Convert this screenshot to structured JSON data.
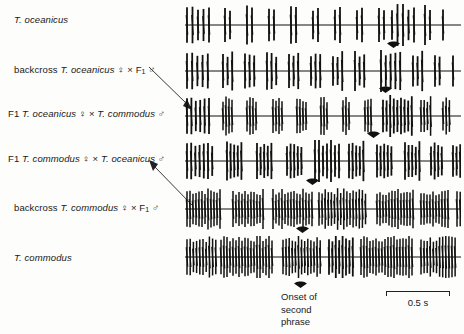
{
  "figure": {
    "kind": "oscillogram-panel",
    "ink_color": "#111111",
    "background": "#fdfdfb"
  },
  "rows": [
    {
      "id": "t-oceanicus",
      "label_parts": [
        "T. oceanicus"
      ],
      "label_plain": "T. oceanicus",
      "onset_arrow_x": 393
    },
    {
      "id": "backcross-oceanicus",
      "label_parts": [
        "backcross ",
        "T. oceanicus",
        " ♀ × F",
        "1",
        " ♂"
      ],
      "label_plain": "backcross T. oceanicus ♀ × F1 ♂",
      "onset_arrow_x": 385
    },
    {
      "id": "f1-oceanicus-x-commodus",
      "label_parts": [
        "F1 ",
        "T. oceanicus",
        " ♀ × ",
        "T. commodus",
        " ♂"
      ],
      "label_plain": "F1 T. oceanicus ♀ × T. commodus ♂",
      "onset_arrow_x": 373
    },
    {
      "id": "f1-commodus-x-oceanicus",
      "label_parts": [
        "F1 ",
        "T. commodus",
        " ♀ × ",
        "T. oceanicus",
        " ♂"
      ],
      "label_plain": "F1 T. commodus ♀ × T. oceanicus ♂",
      "onset_arrow_x": 312
    },
    {
      "id": "backcross-commodus",
      "label_parts": [
        "backcross ",
        "T. commodus",
        " ♀ × F",
        "1",
        " ♂"
      ],
      "label_plain": "backcross T. commodus ♀ × F1 ♂",
      "onset_arrow_x": 302
    },
    {
      "id": "t-commodus",
      "label_parts": [
        "T. commodus"
      ],
      "label_plain": "T. commodus",
      "onset_arrow_x": 300
    }
  ],
  "caption": {
    "line1": "Onset of",
    "line2": "second",
    "line3": "phrase"
  },
  "scale": {
    "label": "0.5 s",
    "duration_s": 0.5,
    "bar_px": 65
  },
  "chart_data": {
    "type": "line",
    "title": "",
    "xlabel": "time",
    "ylabel": "sound pressure",
    "scale_bar_seconds": 0.5,
    "series": [
      {
        "name": "T. oceanicus",
        "groups": [
          {
            "start": 2,
            "pulses": 5,
            "spacing": 5.5,
            "amp": 1.0
          },
          {
            "start": 40,
            "pulses": 2,
            "spacing": 5.0,
            "amp": 0.95
          },
          {
            "start": 62,
            "pulses": 2,
            "spacing": 5.0,
            "amp": 0.95
          },
          {
            "start": 84,
            "pulses": 2,
            "spacing": 5.0,
            "amp": 0.95
          },
          {
            "start": 106,
            "pulses": 2,
            "spacing": 5.0,
            "amp": 0.95
          },
          {
            "start": 128,
            "pulses": 2,
            "spacing": 5.0,
            "amp": 0.95
          },
          {
            "start": 150,
            "pulses": 2,
            "spacing": 5.0,
            "amp": 0.95
          },
          {
            "start": 172,
            "pulses": 2,
            "spacing": 5.0,
            "amp": 0.95
          },
          {
            "start": 194,
            "pulses": 2,
            "spacing": 5.0,
            "amp": 0.95
          },
          {
            "start": 207,
            "pulses": 5,
            "spacing": 5.5,
            "amp": 1.0
          },
          {
            "start": 240,
            "pulses": 2,
            "spacing": 5.0,
            "amp": 0.95
          },
          {
            "start": 258,
            "pulses": 1,
            "spacing": 5.0,
            "amp": 0.9
          }
        ]
      },
      {
        "name": "backcross T. oceanicus ♀ × F1 ♂",
        "groups": [
          {
            "start": 2,
            "pulses": 5,
            "spacing": 5.2,
            "amp": 1.0
          },
          {
            "start": 38,
            "pulses": 3,
            "spacing": 4.6,
            "amp": 0.95
          },
          {
            "start": 60,
            "pulses": 3,
            "spacing": 4.6,
            "amp": 0.95
          },
          {
            "start": 82,
            "pulses": 3,
            "spacing": 4.6,
            "amp": 0.95
          },
          {
            "start": 104,
            "pulses": 3,
            "spacing": 4.6,
            "amp": 0.95
          },
          {
            "start": 126,
            "pulses": 3,
            "spacing": 4.6,
            "amp": 0.95
          },
          {
            "start": 148,
            "pulses": 3,
            "spacing": 4.6,
            "amp": 0.95
          },
          {
            "start": 170,
            "pulses": 3,
            "spacing": 4.6,
            "amp": 0.95
          },
          {
            "start": 196,
            "pulses": 5,
            "spacing": 4.8,
            "amp": 1.0
          },
          {
            "start": 228,
            "pulses": 3,
            "spacing": 4.6,
            "amp": 0.95
          },
          {
            "start": 250,
            "pulses": 2,
            "spacing": 4.6,
            "amp": 0.9
          },
          {
            "start": 268,
            "pulses": 1,
            "spacing": 4.6,
            "amp": 0.85
          }
        ]
      },
      {
        "name": "F1 T. oceanicus ♀ × T. commodus ♂",
        "groups": [
          {
            "start": 2,
            "pulses": 6,
            "spacing": 4.4,
            "amp": 1.0
          },
          {
            "start": 38,
            "pulses": 4,
            "spacing": 3.0,
            "amp": 0.95
          },
          {
            "start": 62,
            "pulses": 4,
            "spacing": 3.0,
            "amp": 0.95
          },
          {
            "start": 88,
            "pulses": 4,
            "spacing": 3.0,
            "amp": 0.95
          },
          {
            "start": 112,
            "pulses": 4,
            "spacing": 3.0,
            "amp": 0.95
          },
          {
            "start": 136,
            "pulses": 3,
            "spacing": 3.0,
            "amp": 0.9
          },
          {
            "start": 158,
            "pulses": 3,
            "spacing": 3.0,
            "amp": 0.9
          },
          {
            "start": 180,
            "pulses": 3,
            "spacing": 3.0,
            "amp": 0.9
          },
          {
            "start": 198,
            "pulses": 9,
            "spacing": 3.6,
            "amp": 1.0
          },
          {
            "start": 236,
            "pulses": 4,
            "spacing": 3.2,
            "amp": 0.95
          },
          {
            "start": 258,
            "pulses": 3,
            "spacing": 3.2,
            "amp": 0.9
          }
        ]
      },
      {
        "name": "F1 T. commodus ♀ × T. oceanicus ♂",
        "groups": [
          {
            "start": 2,
            "pulses": 7,
            "spacing": 4.2,
            "amp": 1.0
          },
          {
            "start": 42,
            "pulses": 5,
            "spacing": 3.6,
            "amp": 0.95
          },
          {
            "start": 72,
            "pulses": 5,
            "spacing": 3.6,
            "amp": 0.95
          },
          {
            "start": 102,
            "pulses": 5,
            "spacing": 3.6,
            "amp": 0.95
          },
          {
            "start": 130,
            "pulses": 7,
            "spacing": 4.0,
            "amp": 1.0
          },
          {
            "start": 164,
            "pulses": 5,
            "spacing": 3.6,
            "amp": 0.95
          },
          {
            "start": 192,
            "pulses": 5,
            "spacing": 3.6,
            "amp": 0.95
          },
          {
            "start": 220,
            "pulses": 5,
            "spacing": 3.6,
            "amp": 0.95
          },
          {
            "start": 246,
            "pulses": 4,
            "spacing": 3.6,
            "amp": 0.9
          },
          {
            "start": 268,
            "pulses": 3,
            "spacing": 3.6,
            "amp": 0.85
          }
        ]
      },
      {
        "name": "backcross T. commodus ♀ × F1 ♂",
        "groups": [
          {
            "start": 2,
            "pulses": 12,
            "spacing": 3.0,
            "amp": 1.0
          },
          {
            "start": 48,
            "pulses": 11,
            "spacing": 3.0,
            "amp": 0.95
          },
          {
            "start": 88,
            "pulses": 14,
            "spacing": 3.0,
            "amp": 0.95
          },
          {
            "start": 134,
            "pulses": 16,
            "spacing": 3.1,
            "amp": 1.0
          },
          {
            "start": 192,
            "pulses": 13,
            "spacing": 3.0,
            "amp": 0.95
          },
          {
            "start": 236,
            "pulses": 10,
            "spacing": 3.0,
            "amp": 0.9
          },
          {
            "start": 272,
            "pulses": 4,
            "spacing": 3.2,
            "amp": 0.85
          }
        ]
      },
      {
        "name": "T. commodus",
        "groups": [
          {
            "start": 2,
            "pulses": 10,
            "spacing": 3.2,
            "amp": 1.0
          },
          {
            "start": 36,
            "pulses": 18,
            "spacing": 3.0,
            "amp": 1.05
          },
          {
            "start": 98,
            "pulses": 13,
            "spacing": 3.1,
            "amp": 1.0
          },
          {
            "start": 144,
            "pulses": 8,
            "spacing": 3.4,
            "amp": 1.05
          },
          {
            "start": 176,
            "pulses": 18,
            "spacing": 3.0,
            "amp": 1.05
          },
          {
            "start": 236,
            "pulses": 12,
            "spacing": 3.1,
            "amp": 1.0
          },
          {
            "start": 278,
            "pulses": 5,
            "spacing": 4.0,
            "amp": 1.0
          }
        ]
      }
    ]
  }
}
